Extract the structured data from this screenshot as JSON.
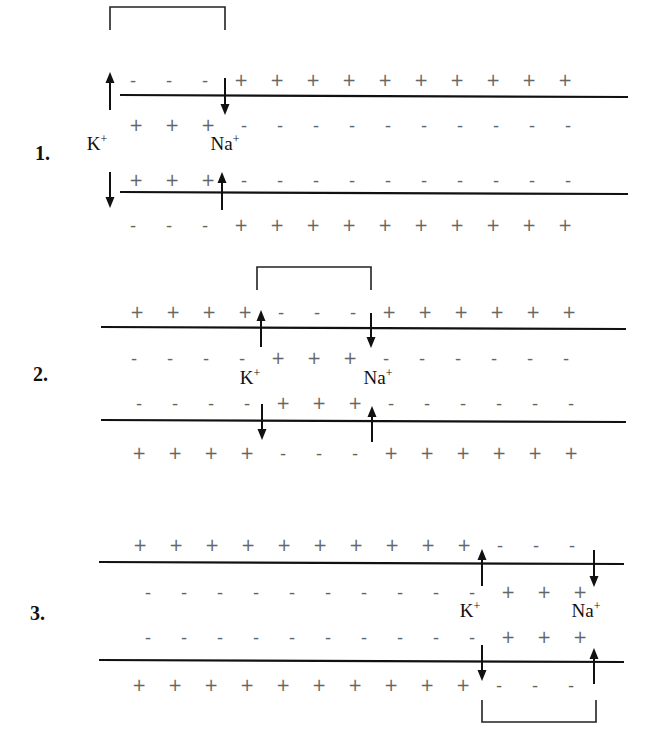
{
  "diagram": {
    "colors": {
      "line": "#111111",
      "charge": "#666666",
      "background": "#ffffff"
    },
    "charge_spacing": 36,
    "panels": [
      {
        "number": "1.",
        "number_pos": [
          35,
          160
        ],
        "membrane_top": {
          "x1": 120,
          "x2": 628,
          "y": 95
        },
        "membrane_bottom": {
          "x1": 120,
          "x2": 628,
          "y": 192
        },
        "rows": {
          "outer_top": {
            "y": 80,
            "x0": 133,
            "signs": "---++++++++++"
          },
          "inner_top": {
            "y": 125,
            "x0": 136,
            "signs": "+++----------"
          },
          "inner_bottom": {
            "y": 180,
            "x0": 136,
            "signs": "+++----------"
          },
          "outer_bottom": {
            "y": 225,
            "x0": 133,
            "signs": "---++++++++++"
          }
        },
        "bracket": {
          "x1": 110,
          "x2": 225,
          "y_top": 7,
          "y_bottom": 30,
          "side": "top"
        },
        "arrows": [
          {
            "x": 110,
            "y1": 110,
            "y2": 72,
            "dir": "up",
            "ion": "K"
          },
          {
            "x": 225,
            "y1": 78,
            "y2": 115,
            "dir": "down",
            "ion": "Na"
          },
          {
            "x": 110,
            "y1": 172,
            "y2": 208,
            "dir": "down",
            "ion": "K"
          },
          {
            "x": 222,
            "y1": 210,
            "y2": 172,
            "dir": "up",
            "ion": "Na"
          }
        ],
        "labels": [
          {
            "text": "K",
            "sup": "+",
            "x": 97,
            "y": 150
          },
          {
            "text": "Na",
            "sup": "+",
            "x": 225,
            "y": 150
          }
        ]
      },
      {
        "number": "2.",
        "number_pos": [
          33,
          381
        ],
        "membrane_top": {
          "x1": 101,
          "x2": 626,
          "y": 327
        },
        "membrane_bottom": {
          "x1": 101,
          "x2": 626,
          "y": 420
        },
        "rows": {
          "outer_top": {
            "y": 312,
            "x0": 137,
            "signs": "++++---++++++"
          },
          "inner_top": {
            "y": 358,
            "x0": 134,
            "signs": "----+++------"
          },
          "inner_bottom": {
            "y": 403,
            "x0": 139,
            "signs": "----+++------"
          },
          "outer_bottom": {
            "y": 453,
            "x0": 139,
            "signs": "++++---++++++"
          }
        },
        "bracket": {
          "x1": 257,
          "x2": 371,
          "y_top": 267,
          "y_bottom": 290,
          "side": "top"
        },
        "arrows": [
          {
            "x": 261,
            "y1": 347,
            "y2": 310,
            "dir": "up",
            "ion": "K"
          },
          {
            "x": 371,
            "y1": 313,
            "y2": 348,
            "dir": "down",
            "ion": "Na"
          },
          {
            "x": 262,
            "y1": 404,
            "y2": 440,
            "dir": "down",
            "ion": "K"
          },
          {
            "x": 372,
            "y1": 442,
            "y2": 406,
            "dir": "up",
            "ion": "Na"
          }
        ],
        "labels": [
          {
            "text": "K",
            "sup": "+",
            "x": 250,
            "y": 384
          },
          {
            "text": "Na",
            "sup": "+",
            "x": 378,
            "y": 384
          }
        ]
      },
      {
        "number": "3.",
        "number_pos": [
          30,
          620
        ],
        "membrane_top": {
          "x1": 99,
          "x2": 624,
          "y": 562
        },
        "membrane_bottom": {
          "x1": 99,
          "x2": 624,
          "y": 660
        },
        "rows": {
          "outer_top": {
            "y": 545,
            "x0": 140,
            "signs": "++++++++++---"
          },
          "inner_top": {
            "y": 592,
            "x0": 148,
            "signs": "----------+++"
          },
          "inner_bottom": {
            "y": 637,
            "x0": 148,
            "signs": "----------+++"
          },
          "outer_bottom": {
            "y": 685,
            "x0": 139,
            "signs": "++++++++++---"
          }
        },
        "bracket": {
          "x1": 482,
          "x2": 596,
          "y_top": 700,
          "y_bottom": 722,
          "side": "bottom"
        },
        "arrows": [
          {
            "x": 482,
            "y1": 586,
            "y2": 549,
            "dir": "up",
            "ion": "K"
          },
          {
            "x": 594,
            "y1": 550,
            "y2": 587,
            "dir": "down",
            "ion": "Na"
          },
          {
            "x": 482,
            "y1": 645,
            "y2": 681,
            "dir": "down",
            "ion": "K"
          },
          {
            "x": 594,
            "y1": 684,
            "y2": 648,
            "dir": "up",
            "ion": "Na"
          }
        ],
        "labels": [
          {
            "text": "K",
            "sup": "+",
            "x": 470,
            "y": 617
          },
          {
            "text": "Na",
            "sup": "+",
            "x": 586,
            "y": 617
          }
        ]
      }
    ]
  }
}
